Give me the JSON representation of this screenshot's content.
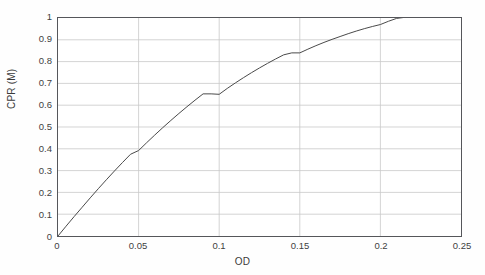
{
  "chart_data": {
    "type": "line",
    "title": "",
    "subtitle": "",
    "xlabel": "OD",
    "ylabel": "CPR (M)",
    "xlim": [
      0,
      0.25
    ],
    "ylim": [
      0,
      1
    ],
    "grid": true,
    "legend": null,
    "legend_position": "none",
    "xticks": [
      0,
      0.05,
      0.1,
      0.15,
      0.2,
      0.25
    ],
    "xtick_labels": [
      "0",
      "0.05",
      "0.1",
      "0.15",
      "0.2",
      "0.25"
    ],
    "yticks": [
      0,
      0.1,
      0.2,
      0.3,
      0.4,
      0.5,
      0.6,
      0.7,
      0.8,
      0.9,
      1
    ],
    "ytick_labels": [
      "0",
      "0.1",
      "0.2",
      "0.3",
      "0.4",
      "0.5",
      "0.6",
      "0.7",
      "0.8",
      "0.9",
      "1"
    ],
    "series": [
      {
        "name": "CPR (M)",
        "color": "#4a4a4a",
        "line_width": 1,
        "x": [
          0,
          0.005,
          0.01,
          0.015,
          0.02,
          0.025,
          0.03,
          0.035,
          0.04,
          0.045,
          0.05,
          0.055,
          0.06,
          0.065,
          0.07,
          0.075,
          0.08,
          0.085,
          0.09,
          0.095,
          0.1,
          0.105,
          0.11,
          0.115,
          0.12,
          0.125,
          0.13,
          0.135,
          0.14,
          0.145,
          0.15,
          0.155,
          0.16,
          0.165,
          0.17,
          0.175,
          0.18,
          0.185,
          0.19,
          0.195,
          0.2,
          0.205,
          0.21,
          0.215,
          0.22
        ],
        "y": [
          0,
          0.045,
          0.089,
          0.132,
          0.175,
          0.217,
          0.258,
          0.298,
          0.337,
          0.375,
          0.392,
          0.428,
          0.463,
          0.497,
          0.53,
          0.562,
          0.593,
          0.623,
          0.652,
          0.652,
          0.65,
          0.677,
          0.702,
          0.726,
          0.749,
          0.771,
          0.792,
          0.812,
          0.831,
          0.84,
          0.84,
          0.857,
          0.873,
          0.888,
          0.902,
          0.915,
          0.928,
          0.94,
          0.951,
          0.961,
          0.97,
          0.985,
          0.998,
          1.003,
          1.004
        ]
      }
    ],
    "annotations": []
  },
  "axis": {
    "y_title": "CPR (M)",
    "x_title": "OD"
  },
  "colors": {
    "grid": "#c9c9c9",
    "frame": "#55565a",
    "curve": "#4a4a4a",
    "text": "#3f3f3f",
    "background": "#ffffff"
  }
}
